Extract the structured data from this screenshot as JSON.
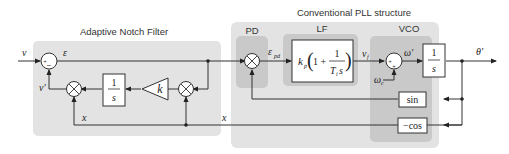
{
  "diagram": {
    "title_anf": "Adaptive Notch Filter",
    "title_pll": "Conventional PLL structure",
    "blocks": {
      "pd": "PD",
      "lf": "LF",
      "vco": "VCO"
    },
    "signals": {
      "input": "v",
      "error": "ε",
      "estimate": "v'",
      "x_left": "x",
      "x_mid": "x",
      "eps_pd_main": "ε",
      "eps_pd_sub": "pd",
      "vf_main": "v",
      "vf_sub": "f",
      "omega_prime": "ω'",
      "omega_c_main": "ω",
      "omega_c_sub": "c",
      "output": "θ'"
    },
    "gain_label": "k",
    "integrator_num": "1",
    "integrator_den": "s",
    "lf_formula": {
      "kp_main": "k",
      "kp_sub": "p",
      "paren_open": "(",
      "one_plus": "1 +",
      "frac_num": "1",
      "frac_den_main": "T",
      "frac_den_sub": "i",
      "frac_den_s": "s",
      "paren_close": ")"
    },
    "vco_integrator_num": "1",
    "vco_integrator_den": "s",
    "sin_label": "sin",
    "cos_label": "−cos",
    "sum_signs": {
      "anf_plus": "+",
      "anf_minus": "−",
      "vco_plus1": "+",
      "vco_plus2": "+"
    },
    "multiply_symbol": "×",
    "colors": {
      "outer_panel": "#e3e3e3",
      "inner_panel": "#c9c9c9",
      "line": "#333333",
      "block_fill": "#ffffff"
    }
  }
}
